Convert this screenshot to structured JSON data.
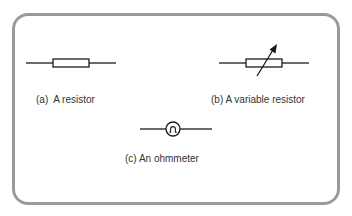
{
  "figure": {
    "colors": {
      "frame_border": "#9a9a9a",
      "stroke": "#1a1a1a",
      "label_text": "#333333",
      "background": "#ffffff"
    },
    "symbols": [
      {
        "id": "a",
        "kind": "resistor",
        "caption": "(a)  A resistor"
      },
      {
        "id": "b",
        "kind": "variable-resistor",
        "caption": "(b) A variable resistor"
      },
      {
        "id": "c",
        "kind": "ohmmeter",
        "caption": "(c) An ohmmeter",
        "glyph": "Ω"
      }
    ]
  }
}
